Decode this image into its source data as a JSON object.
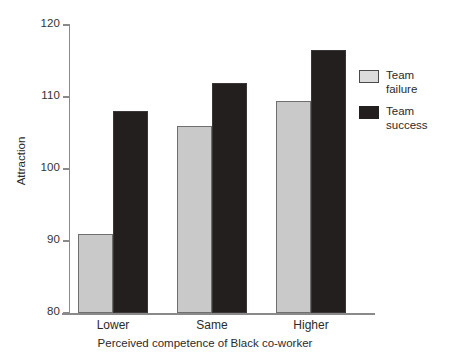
{
  "chart_data": {
    "type": "bar",
    "title": "",
    "xlabel": "Perceived competence of Black co-worker",
    "ylabel": "Attraction",
    "categories": [
      "Lower",
      "Same",
      "Higher"
    ],
    "series": [
      {
        "name": "Team failure",
        "values": [
          91,
          106,
          109.5
        ],
        "color": "#c9c9c9"
      },
      {
        "name": "Team success",
        "values": [
          108,
          112,
          116.5
        ],
        "color": "#231f1f"
      }
    ],
    "ylim": [
      80,
      120
    ],
    "yticks": [
      80,
      90,
      100,
      110,
      120
    ],
    "ytick_labels": [
      "80",
      "90",
      "100",
      "110",
      "120"
    ],
    "grid": false,
    "legend_position": "right"
  },
  "legend": {
    "entries": [
      {
        "label_line1": "Team",
        "label_line2": "failure",
        "swatch": "failure-swatch"
      },
      {
        "label_line1": "Team",
        "label_line2": "success",
        "swatch": "success-swatch"
      }
    ]
  }
}
